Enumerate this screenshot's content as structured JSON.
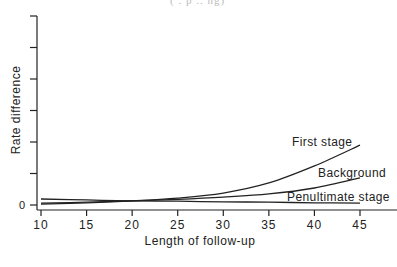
{
  "header": {
    "fragment": "(    .     p     ..    ng)"
  },
  "chart_data": {
    "type": "line",
    "title": "",
    "xlabel": "Length of follow-up",
    "ylabel": "Rate difference",
    "xlim": [
      10,
      45
    ],
    "ylim": [
      0,
      6
    ],
    "x_ticks": [
      10,
      15,
      20,
      25,
      30,
      35,
      40,
      45
    ],
    "y_ticks": [
      0,
      1,
      2,
      3,
      4,
      5,
      6
    ],
    "y_tick_labels": [
      "0",
      "",
      "",
      "",
      "",
      "",
      ""
    ],
    "grid": false,
    "legend": "inline labels at right end of curves",
    "x": [
      10,
      15,
      20,
      25,
      30,
      35,
      40,
      45
    ],
    "series": [
      {
        "name": "First stage",
        "values": [
          0.03,
          0.07,
          0.13,
          0.22,
          0.38,
          0.7,
          1.24,
          1.9
        ]
      },
      {
        "name": "Background",
        "values": [
          0.06,
          0.09,
          0.13,
          0.18,
          0.25,
          0.35,
          0.54,
          0.86
        ]
      },
      {
        "name": "Penultimate stage",
        "values": [
          0.19,
          0.16,
          0.13,
          0.12,
          0.1,
          0.09,
          0.07,
          0.06
        ]
      }
    ]
  }
}
